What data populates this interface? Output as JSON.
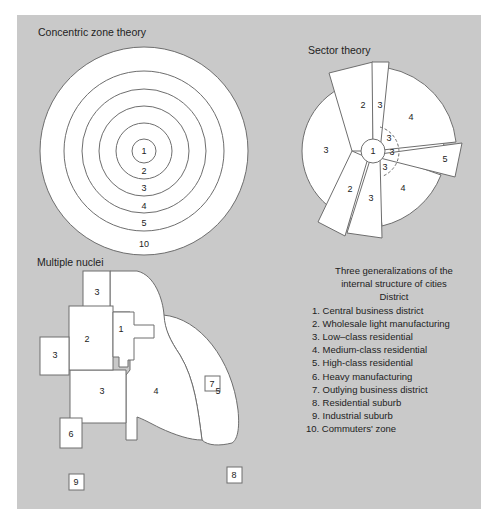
{
  "concentric": {
    "title": "Concentric zone theory",
    "zones": [
      {
        "label": "1",
        "radius": 12
      },
      {
        "label": "2",
        "radius": 28
      },
      {
        "label": "3",
        "radius": 45
      },
      {
        "label": "4",
        "radius": 62
      },
      {
        "label": "5",
        "radius": 80
      },
      {
        "label": "10",
        "radius": 104
      }
    ]
  },
  "sector": {
    "title": "Sector theory",
    "labels": [
      "1",
      "2",
      "3",
      "3",
      "4",
      "3",
      "3",
      "3",
      "5",
      "4",
      "3",
      "2"
    ]
  },
  "nuclei": {
    "title": "Multiple nuclei",
    "labels": [
      "1",
      "2",
      "3",
      "3",
      "3",
      "4",
      "5",
      "6",
      "7",
      "8",
      "9"
    ]
  },
  "legend": {
    "heading_line1": "Three generalizations of the",
    "heading_line2": "internal structure of cities",
    "subheading": "District",
    "items": [
      "1. Central business district",
      "2. Wholesale light manufacturing",
      "3. Low–class residential",
      "4. Medium-class residential",
      "5. High-class residential",
      "6. Heavy manufacturing",
      "7. Outlying business district",
      "8. Residential suburb",
      "9. Industrial suburb",
      "10. Commuters' zone"
    ]
  },
  "colors": {
    "background": "#c9c9c9",
    "fill": "#ffffff",
    "stroke": "#6e6e6e"
  }
}
